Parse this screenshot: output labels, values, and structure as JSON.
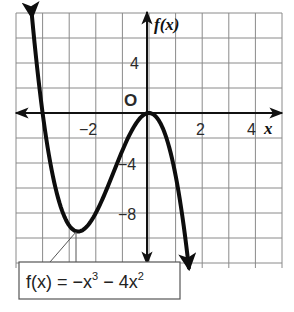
{
  "chart_data": {
    "type": "line",
    "title": "",
    "function": "f(x) = -x^3 - 4x^2",
    "xlabel": "x",
    "ylabel": "f(x)",
    "origin_label": "O",
    "xlim": [
      -5,
      5
    ],
    "ylim": [
      -12,
      8
    ],
    "grid": true,
    "grid_step_x": 1,
    "grid_step_y": 2,
    "x_ticks": [
      {
        "value": -2,
        "label": "−2"
      },
      {
        "value": 2,
        "label": "2"
      },
      {
        "value": 4,
        "label": "4"
      }
    ],
    "y_ticks": [
      {
        "value": 4,
        "label": "4"
      },
      {
        "value": -4,
        "label": "−4"
      },
      {
        "value": -8,
        "label": "−8"
      }
    ],
    "series": [
      {
        "name": "f(x) = -x^3 - 4x^2",
        "x": [
          -4.4,
          -4.0,
          -3.5,
          -3.0,
          -2.667,
          -2.0,
          -1.5,
          -1.0,
          -0.5,
          0.0,
          0.5,
          1.0,
          1.5
        ],
        "values": [
          7.74,
          0.0,
          -6.13,
          -9.0,
          -9.48,
          -8.0,
          -5.63,
          -3.0,
          -0.88,
          0.0,
          -1.13,
          -5.0,
          -12.38
        ]
      }
    ],
    "key_points": {
      "local_max": {
        "x": 0,
        "y": 0
      },
      "local_min": {
        "x": -2.667,
        "y": -9.48
      },
      "x_intercepts": [
        -4,
        0
      ]
    },
    "annotation": {
      "label": "f(x) = −x³ − 4x²",
      "points_to": "local_min"
    }
  },
  "labels": {
    "y_axis": "f(x)",
    "x_axis": "x",
    "origin": "O",
    "tick_x_neg2": "−2",
    "tick_x_2": "2",
    "tick_x_4": "4",
    "tick_y_4": "4",
    "tick_y_neg4": "−4",
    "tick_y_neg8": "−8",
    "eq_prefix": "f(x) = −x",
    "eq_exp1": "3",
    "eq_mid": " − 4x",
    "eq_exp2": "2"
  },
  "colors": {
    "grid": "#8a8a8a",
    "axis": "#111111",
    "curve": "#0d0d0d",
    "label_box_border": "#555555"
  }
}
